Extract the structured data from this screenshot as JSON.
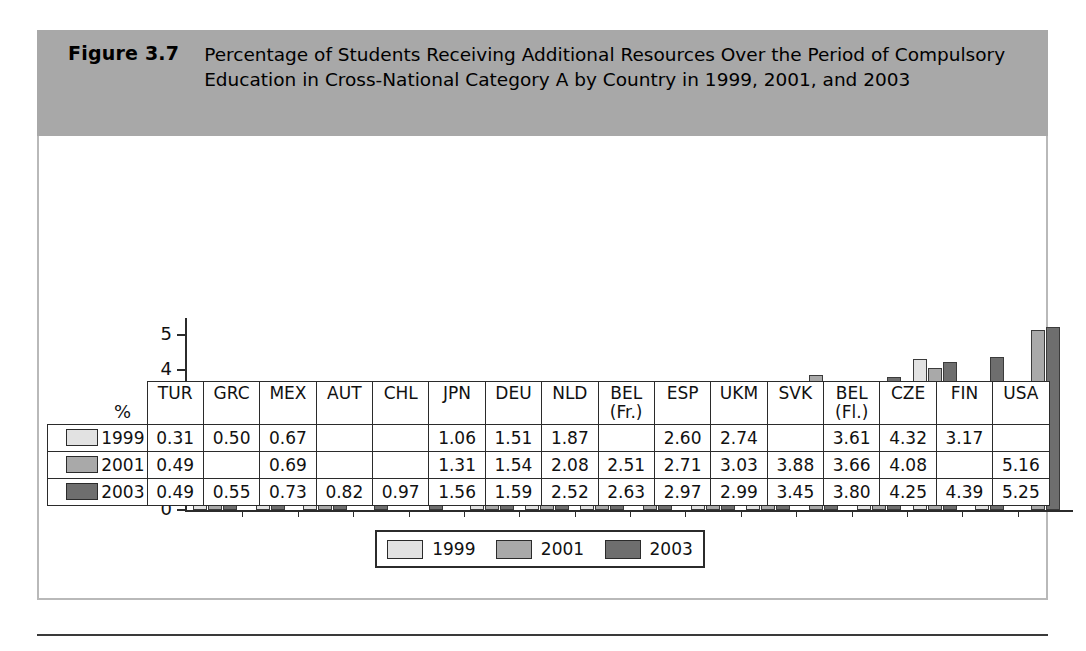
{
  "figure": {
    "label": "Figure 3.7",
    "title": "Percentage of Students Receiving Additional Resources Over the Period of Compulsory Education in Cross-National Category A by Country in 1999, 2001, and 2003"
  },
  "axis": {
    "y_unit": "%",
    "y_ticks": [
      "0",
      "1",
      "2",
      "3",
      "4",
      "5"
    ],
    "y_min": 0,
    "y_max": 5.5
  },
  "legend": {
    "position": "bottom",
    "items": [
      {
        "label": "1999",
        "color": "#e2e2e2"
      },
      {
        "label": "2001",
        "color": "#a9a9a9"
      },
      {
        "label": "2003",
        "color": "#6e6e6e"
      }
    ]
  },
  "table": {
    "row_labels": [
      "1999",
      "2001",
      "2003"
    ]
  },
  "chart_data": {
    "type": "bar",
    "title": "Percentage of Students Receiving Additional Resources Over the Period of Compulsory Education in Cross-National Category A by Country in 1999, 2001, and 2003",
    "xlabel": "",
    "ylabel": "%",
    "ylim": [
      0,
      5.5
    ],
    "grid": false,
    "legend_position": "bottom",
    "categories": [
      "TUR",
      "GRC",
      "MEX",
      "AUT",
      "CHL",
      "JPN",
      "DEU",
      "NLD",
      "BEL (Fr.)",
      "ESP",
      "UKM",
      "SVK",
      "BEL (Fl.)",
      "CZE",
      "FIN",
      "USA"
    ],
    "series": [
      {
        "name": "1999",
        "color": "#e2e2e2",
        "values": [
          0.31,
          0.5,
          0.67,
          null,
          null,
          1.06,
          1.51,
          1.87,
          null,
          2.6,
          2.74,
          null,
          3.61,
          4.32,
          3.17,
          null
        ]
      },
      {
        "name": "2001",
        "color": "#a9a9a9",
        "values": [
          0.49,
          null,
          0.69,
          null,
          null,
          1.31,
          1.54,
          2.08,
          2.51,
          2.71,
          3.03,
          3.88,
          3.66,
          4.08,
          null,
          5.16
        ]
      },
      {
        "name": "2003",
        "color": "#6e6e6e",
        "values": [
          0.49,
          0.55,
          0.73,
          0.82,
          0.97,
          1.56,
          1.59,
          2.52,
          2.63,
          2.97,
          2.99,
          3.45,
          3.8,
          4.25,
          4.39,
          5.25
        ]
      }
    ]
  }
}
